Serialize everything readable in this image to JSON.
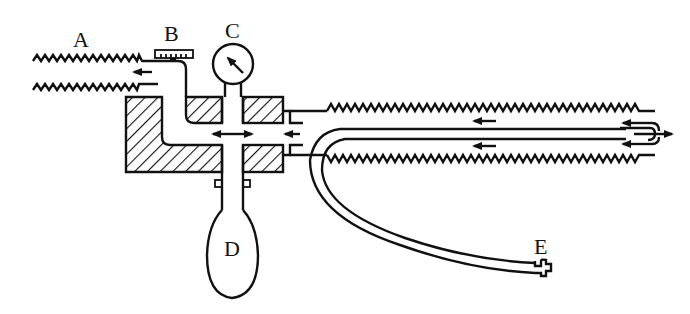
{
  "diagram": {
    "type": "schematic",
    "labels": {
      "A": "A",
      "B": "B",
      "C": "C",
      "D": "D",
      "E": "E"
    },
    "components": [
      {
        "id": "A",
        "name": "corrugated inlet/outlet tube (left)"
      },
      {
        "id": "B",
        "name": "valve/adjustment knob"
      },
      {
        "id": "C",
        "name": "pressure gauge"
      },
      {
        "id": "D",
        "name": "rubber bulb pump"
      },
      {
        "id": "E",
        "name": "flexible hose end connector"
      }
    ],
    "colors": {
      "ink": "#111111",
      "background": "#ffffff"
    }
  }
}
